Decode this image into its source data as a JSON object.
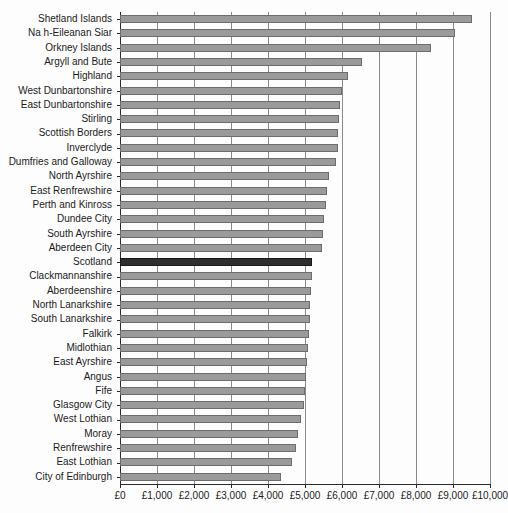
{
  "chart_data": {
    "type": "bar",
    "orientation": "horizontal",
    "title": "",
    "subtitle": "",
    "xlabel": "",
    "ylabel": "",
    "xlim": [
      0,
      10000
    ],
    "grid": true,
    "legend": false,
    "currency_prefix": "£",
    "xticks": [
      0,
      1000,
      2000,
      3000,
      4000,
      5000,
      6000,
      7000,
      8000,
      9000,
      10000
    ],
    "xtick_labels": [
      "£0",
      "£1,000",
      "£2,000",
      "£3,000",
      "£4,000",
      "£5,000",
      "£6,000",
      "£7,000",
      "£8,000",
      "£9,000",
      "£10,000"
    ],
    "highlight_category": "Scotland",
    "bar_color": "#9a9a9a",
    "bar_edge_color": "#6d6d6d",
    "highlight_color": "#2e2e2e",
    "highlight_edge_color": "#1a1a1a",
    "grid_color": "#8b8b8b",
    "axis_color": "#2b2b2b",
    "background_color": "#fdfdfd",
    "categories": [
      "Shetland Islands",
      "Na h-Eileanan Siar",
      "Orkney Islands",
      "Argyll and Bute",
      "Highland",
      "West Dunbartonshire",
      "East Dunbartonshire",
      "Stirling",
      "Scottish Borders",
      "Inverclyde",
      "Dumfries and Galloway",
      "North Ayrshire",
      "East Renfrewshire",
      "Perth and Kinross",
      "Dundee City",
      "South Ayrshire",
      "Aberdeen City",
      "Scotland",
      "Clackmannanshire",
      "Aberdeenshire",
      "North Lanarkshire",
      "South Lanarkshire",
      "Falkirk",
      "Midlothian",
      "East Ayrshire",
      "Angus",
      "Fife",
      "Glasgow City",
      "West Lothian",
      "Moray",
      "Renfrewshire",
      "East Lothian",
      "City of Edinburgh"
    ],
    "values": [
      9500,
      9050,
      8400,
      6550,
      6150,
      6000,
      5950,
      5930,
      5900,
      5880,
      5850,
      5650,
      5600,
      5580,
      5520,
      5480,
      5450,
      5200,
      5180,
      5160,
      5140,
      5130,
      5100,
      5080,
      5060,
      5040,
      5000,
      4960,
      4900,
      4800,
      4750,
      4650,
      4350
    ]
  }
}
